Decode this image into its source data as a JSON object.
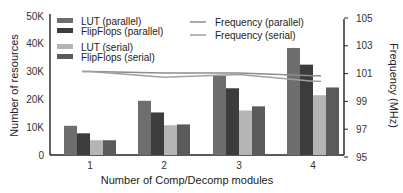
{
  "chart_data": {
    "type": "bar",
    "title": "",
    "xlabel": "Number of Comp/Decomp modules",
    "ylabel": "Number of resources",
    "y2label": "Frequency (MHz)",
    "categories": [
      "1",
      "2",
      "3",
      "4"
    ],
    "ylim": [
      0,
      50000
    ],
    "y2lim": [
      95,
      105
    ],
    "yticks": [
      "0",
      "10K",
      "20K",
      "30K",
      "40K",
      "50K"
    ],
    "y2ticks": [
      "95",
      "97",
      "99",
      "101",
      "103",
      "105"
    ],
    "grid": false,
    "legend_position": "upper-left (bars), upper-center (lines)",
    "series": [
      {
        "name": "LUT (parallel)",
        "kind": "bar",
        "color": "#6e6e6e",
        "values": [
          10500,
          19500,
          28500,
          38500
        ]
      },
      {
        "name": "FlipFlops (parallel)",
        "kind": "bar",
        "color": "#3c3c3c",
        "values": [
          7800,
          15300,
          24000,
          32500
        ]
      },
      {
        "name": "LUT (serial)",
        "kind": "bar",
        "color": "#b4b4b4",
        "values": [
          5300,
          10700,
          16000,
          21500
        ]
      },
      {
        "name": "FlipFlops (serial)",
        "kind": "bar",
        "color": "#5a5a5a",
        "values": [
          5300,
          11000,
          17500,
          24300
        ]
      },
      {
        "name": "Frequency (parallel)",
        "kind": "line",
        "axis": "right",
        "color": "#8c8c8c",
        "values": [
          101.0,
          100.9,
          100.9,
          100.7
        ]
      },
      {
        "name": "Frequency (serial)",
        "kind": "line",
        "axis": "right",
        "color": "#a0a0a0",
        "values": [
          101.0,
          100.6,
          100.8,
          100.3
        ]
      }
    ]
  }
}
